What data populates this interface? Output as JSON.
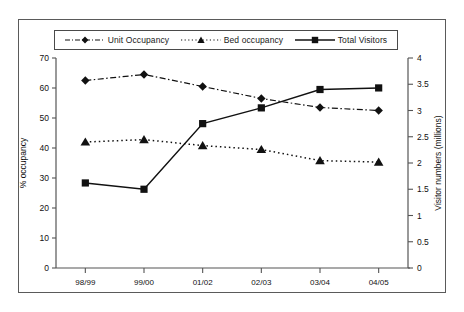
{
  "chart_data": {
    "type": "line",
    "title": "",
    "subtitle": "",
    "xlabel": "",
    "ylabel": "% occupancy",
    "y2label": "Visitor numbers (millions)",
    "categories": [
      "98/99",
      "99/00",
      "01/02",
      "02/03",
      "03/04",
      "04/05"
    ],
    "ylim": [
      0,
      70
    ],
    "yticks": [
      "0",
      "10",
      "20",
      "30",
      "40",
      "50",
      "60",
      "70"
    ],
    "y2lim": [
      0,
      4
    ],
    "y2ticks": [
      "0",
      "0.5",
      "1",
      "1.5",
      "2",
      "2.5",
      "3",
      "3.5",
      "4"
    ],
    "grid": false,
    "legend_position": "top",
    "series": [
      {
        "name": "Unit Occupancy",
        "axis": "left",
        "marker": "diamond",
        "line_style": "dash-dot",
        "color": "#111111",
        "values": [
          62.5,
          64.5,
          60.5,
          56.5,
          53.5,
          52.5
        ]
      },
      {
        "name": "Bed occupancy",
        "axis": "left",
        "marker": "triangle",
        "line_style": "dotted",
        "color": "#111111",
        "values": [
          42.0,
          42.8,
          40.8,
          39.5,
          35.8,
          35.3
        ]
      },
      {
        "name": "Total Visitors",
        "axis": "right",
        "marker": "square",
        "line_style": "solid",
        "color": "#111111",
        "values": [
          1.62,
          1.5,
          2.75,
          3.05,
          3.4,
          3.43
        ]
      }
    ]
  },
  "legend": {
    "items": [
      {
        "label": "Unit Occupancy",
        "marker": "diamond-marker",
        "style": "dash-dot"
      },
      {
        "label": "Bed occupancy",
        "marker": "triangle-marker",
        "style": "dotted"
      },
      {
        "label": "Total Visitors",
        "marker": "square-marker",
        "style": "solid"
      }
    ]
  }
}
